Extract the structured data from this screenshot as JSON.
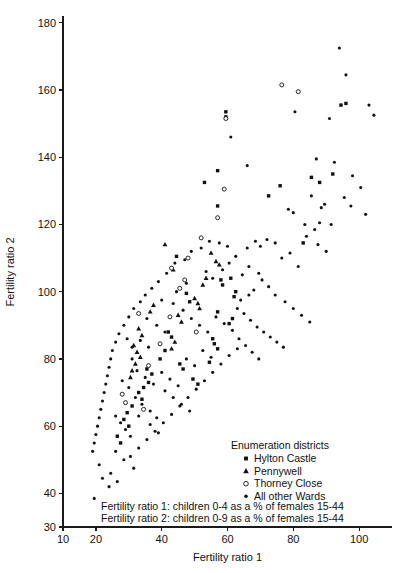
{
  "chart_data": {
    "type": "scatter",
    "title": "",
    "xlabel": "Fertility ratio 1",
    "ylabel": "Fertility ratio 2",
    "xlim": [
      10,
      110
    ],
    "ylim": [
      30,
      182
    ],
    "xticks": [
      10,
      20,
      40,
      60,
      80,
      100
    ],
    "yticks": [
      30,
      40,
      60,
      80,
      100,
      120,
      140,
      160,
      180
    ],
    "grid": false,
    "legend_position": "inside-lower-right",
    "legend_title": "Enumeration districts",
    "series": [
      {
        "name": "Hylton Castle",
        "marker": "square",
        "points": [
          [
            59.5,
            153.5
          ],
          [
            59.5,
            152.0
          ],
          [
            94.5,
            155.5
          ],
          [
            96.0,
            156.0
          ],
          [
            57.0,
            136.0
          ],
          [
            53.0,
            132.5
          ],
          [
            57.0,
            125.5
          ],
          [
            76.0,
            131.5
          ],
          [
            72.5,
            128.5
          ],
          [
            88.0,
            132.5
          ],
          [
            85.5,
            134.0
          ],
          [
            92.0,
            135.0
          ],
          [
            44.5,
            110.5
          ],
          [
            83.0,
            114.5
          ],
          [
            62.5,
            100.0
          ],
          [
            62.0,
            98.5
          ],
          [
            61.0,
            104.0
          ],
          [
            58.0,
            103.5
          ],
          [
            58.5,
            102.0
          ],
          [
            47.5,
            99.5
          ],
          [
            48.5,
            97.0
          ],
          [
            57.0,
            94.0
          ],
          [
            61.5,
            92.0
          ],
          [
            60.5,
            90.5
          ],
          [
            42.0,
            88.0
          ],
          [
            43.0,
            86.5
          ],
          [
            41.0,
            82.5
          ],
          [
            39.5,
            80.0
          ],
          [
            55.5,
            86.0
          ],
          [
            56.0,
            84.5
          ],
          [
            57.0,
            83.0
          ],
          [
            54.5,
            79.0
          ],
          [
            36.0,
            73.0
          ],
          [
            34.5,
            71.5
          ],
          [
            33.0,
            70.0
          ],
          [
            34.0,
            68.0
          ],
          [
            31.0,
            66.0
          ],
          [
            29.5,
            64.0
          ],
          [
            28.5,
            62.0
          ],
          [
            30.0,
            60.0
          ],
          [
            35.5,
            77.0
          ],
          [
            37.0,
            75.5
          ],
          [
            45.5,
            78.5
          ],
          [
            46.5,
            77.0
          ],
          [
            49.5,
            74.0
          ],
          [
            51.0,
            72.5
          ],
          [
            26.5,
            57.0
          ],
          [
            27.5,
            55.0
          ]
        ]
      },
      {
        "name": "Pennywell",
        "marker": "triangle",
        "points": [
          [
            41.0,
            114.0
          ],
          [
            43.5,
            106.5
          ],
          [
            55.0,
            111.5
          ],
          [
            56.5,
            109.0
          ],
          [
            57.5,
            108.0
          ],
          [
            53.5,
            104.0
          ],
          [
            52.5,
            102.0
          ],
          [
            37.5,
            96.0
          ],
          [
            36.5,
            94.0
          ],
          [
            50.0,
            98.0
          ],
          [
            51.0,
            96.5
          ],
          [
            51.5,
            95.0
          ],
          [
            33.0,
            89.0
          ],
          [
            34.0,
            87.0
          ],
          [
            45.0,
            93.0
          ],
          [
            46.0,
            91.0
          ],
          [
            31.5,
            84.0
          ],
          [
            32.5,
            82.0
          ],
          [
            33.5,
            80.5
          ],
          [
            32.0,
            78.5
          ],
          [
            31.0,
            76.5
          ],
          [
            30.5,
            74.5
          ],
          [
            44.0,
            85.0
          ],
          [
            43.0,
            83.0
          ]
        ]
      },
      {
        "name": "Thorney Close",
        "marker": "circle-open",
        "points": [
          [
            76.5,
            161.5
          ],
          [
            81.5,
            159.5
          ],
          [
            59.5,
            151.5
          ],
          [
            59.0,
            130.5
          ],
          [
            57.0,
            122.0
          ],
          [
            48.0,
            110.0
          ],
          [
            43.0,
            107.0
          ],
          [
            33.0,
            93.5
          ],
          [
            42.5,
            92.5
          ],
          [
            39.5,
            84.5
          ],
          [
            36.0,
            78.0
          ],
          [
            28.0,
            69.5
          ],
          [
            29.0,
            67.0
          ],
          [
            34.5,
            65.0
          ],
          [
            45.5,
            101.0
          ],
          [
            47.0,
            103.5
          ],
          [
            52.0,
            116.0
          ],
          [
            50.5,
            88.0
          ]
        ]
      },
      {
        "name": "All other Wards",
        "marker": "dot",
        "points": [
          [
            94.0,
            172.5
          ],
          [
            96.0,
            164.5
          ],
          [
            80.5,
            153.5
          ],
          [
            91.0,
            151.5
          ],
          [
            103.0,
            155.5
          ],
          [
            104.5,
            152.5
          ],
          [
            61.0,
            146.0
          ],
          [
            66.0,
            137.5
          ],
          [
            87.0,
            139.5
          ],
          [
            92.5,
            138.5
          ],
          [
            78.5,
            124.5
          ],
          [
            80.0,
            123.5
          ],
          [
            85.5,
            128.5
          ],
          [
            88.5,
            125.0
          ],
          [
            89.5,
            126.0
          ],
          [
            83.5,
            120.0
          ],
          [
            86.5,
            118.5
          ],
          [
            88.0,
            120.5
          ],
          [
            91.5,
            120.0
          ],
          [
            72.0,
            115.5
          ],
          [
            74.5,
            114.5
          ],
          [
            70.0,
            113.5
          ],
          [
            81.5,
            107.5
          ],
          [
            69.5,
            105.5
          ],
          [
            70.5,
            103.5
          ],
          [
            68.0,
            100.5
          ],
          [
            66.5,
            99.0
          ],
          [
            64.0,
            97.5
          ],
          [
            63.0,
            95.0
          ],
          [
            65.0,
            93.5
          ],
          [
            67.0,
            91.5
          ],
          [
            69.0,
            89.5
          ],
          [
            71.0,
            88.0
          ],
          [
            73.0,
            86.5
          ],
          [
            75.0,
            85.0
          ],
          [
            77.0,
            83.5
          ],
          [
            60.0,
            113.5
          ],
          [
            57.5,
            114.5
          ],
          [
            54.5,
            115.0
          ],
          [
            52.0,
            113.0
          ],
          [
            49.0,
            112.0
          ],
          [
            47.0,
            109.5
          ],
          [
            44.0,
            108.5
          ],
          [
            41.5,
            105.5
          ],
          [
            39.0,
            103.0
          ],
          [
            37.0,
            101.0
          ],
          [
            35.0,
            99.0
          ],
          [
            33.5,
            97.0
          ],
          [
            31.5,
            95.0
          ],
          [
            30.0,
            92.5
          ],
          [
            28.5,
            90.0
          ],
          [
            27.0,
            87.5
          ],
          [
            26.0,
            85.0
          ],
          [
            25.0,
            82.5
          ],
          [
            24.5,
            80.0
          ],
          [
            24.0,
            77.5
          ],
          [
            23.5,
            75.0
          ],
          [
            23.0,
            72.5
          ],
          [
            22.5,
            70.0
          ],
          [
            22.0,
            67.5
          ],
          [
            21.5,
            65.0
          ],
          [
            21.0,
            62.5
          ],
          [
            20.5,
            60.0
          ],
          [
            20.0,
            57.5
          ],
          [
            19.5,
            55.0
          ],
          [
            19.0,
            52.5
          ],
          [
            21.0,
            48.5
          ],
          [
            24.5,
            46.0
          ],
          [
            26.5,
            43.5
          ],
          [
            19.5,
            38.5
          ],
          [
            30.5,
            51.0
          ],
          [
            33.0,
            53.5
          ],
          [
            35.5,
            56.0
          ],
          [
            38.0,
            58.5
          ],
          [
            40.5,
            61.0
          ],
          [
            43.0,
            63.5
          ],
          [
            45.5,
            66.0
          ],
          [
            48.0,
            68.5
          ],
          [
            50.5,
            71.0
          ],
          [
            53.0,
            73.5
          ],
          [
            55.5,
            76.0
          ],
          [
            58.0,
            78.5
          ],
          [
            60.5,
            81.0
          ],
          [
            63.0,
            83.0
          ],
          [
            26.0,
            63.0
          ],
          [
            27.5,
            61.0
          ],
          [
            29.0,
            59.0
          ],
          [
            30.5,
            57.0
          ],
          [
            32.0,
            68.5
          ],
          [
            34.0,
            66.5
          ],
          [
            36.5,
            64.5
          ],
          [
            38.5,
            62.5
          ],
          [
            41.0,
            70.5
          ],
          [
            43.5,
            68.5
          ],
          [
            46.0,
            66.5
          ],
          [
            48.5,
            64.5
          ],
          [
            28.0,
            73.5
          ],
          [
            30.0,
            71.5
          ],
          [
            32.5,
            76.5
          ],
          [
            35.0,
            74.5
          ],
          [
            37.5,
            72.5
          ],
          [
            40.0,
            76.0
          ],
          [
            42.5,
            74.0
          ],
          [
            45.0,
            72.0
          ],
          [
            47.5,
            80.0
          ],
          [
            50.0,
            78.0
          ],
          [
            52.5,
            82.5
          ],
          [
            55.0,
            80.5
          ],
          [
            29.5,
            86.0
          ],
          [
            31.0,
            83.5
          ],
          [
            33.5,
            85.5
          ],
          [
            36.0,
            83.5
          ],
          [
            38.5,
            90.0
          ],
          [
            41.0,
            88.0
          ],
          [
            43.5,
            96.5
          ],
          [
            46.5,
            94.5
          ],
          [
            49.0,
            92.0
          ],
          [
            51.5,
            90.0
          ],
          [
            54.0,
            88.0
          ],
          [
            56.5,
            92.5
          ],
          [
            59.0,
            90.5
          ],
          [
            61.5,
            88.5
          ],
          [
            64.5,
            105.0
          ],
          [
            66.5,
            107.5
          ],
          [
            53.5,
            106.0
          ],
          [
            55.5,
            104.0
          ],
          [
            58.5,
            106.5
          ],
          [
            60.5,
            108.5
          ],
          [
            62.5,
            110.5
          ],
          [
            44.5,
            100.0
          ],
          [
            47.5,
            102.5
          ],
          [
            40.0,
            97.5
          ],
          [
            35.5,
            92.0
          ],
          [
            31.0,
            80.0
          ],
          [
            33.0,
            63.0
          ],
          [
            36.5,
            60.5
          ],
          [
            39.0,
            58.0
          ],
          [
            26.0,
            52.5
          ],
          [
            28.5,
            50.0
          ],
          [
            31.5,
            47.5
          ],
          [
            22.0,
            44.5
          ],
          [
            24.0,
            42.0
          ],
          [
            68.5,
            115.0
          ],
          [
            66.0,
            113.0
          ],
          [
            79.0,
            111.5
          ],
          [
            76.5,
            110.0
          ],
          [
            84.0,
            116.5
          ],
          [
            87.5,
            114.0
          ],
          [
            90.0,
            112.0
          ],
          [
            98.0,
            134.5
          ],
          [
            100.5,
            131.0
          ],
          [
            95.5,
            128.0
          ],
          [
            97.5,
            125.5
          ],
          [
            102.0,
            123.0
          ],
          [
            72.5,
            101.5
          ],
          [
            74.5,
            99.0
          ],
          [
            77.5,
            97.0
          ],
          [
            80.0,
            95.0
          ],
          [
            82.5,
            93.0
          ],
          [
            85.0,
            91.0
          ],
          [
            63.5,
            86.0
          ],
          [
            65.5,
            84.0
          ],
          [
            67.5,
            82.0
          ],
          [
            69.5,
            80.0
          ]
        ]
      }
    ],
    "legend_entries": [
      {
        "label": "Hylton Castle",
        "marker": "square"
      },
      {
        "label": "Pennywell",
        "marker": "triangle"
      },
      {
        "label": "Thorney Close",
        "marker": "circle-open"
      },
      {
        "label": "All other Wards",
        "marker": "dot"
      }
    ],
    "notes": [
      "Fertility ratio 1: children 0-4 as a % of females 15-44",
      "Fertility ratio 2: children 0-9 as a % of females 15-44"
    ]
  }
}
